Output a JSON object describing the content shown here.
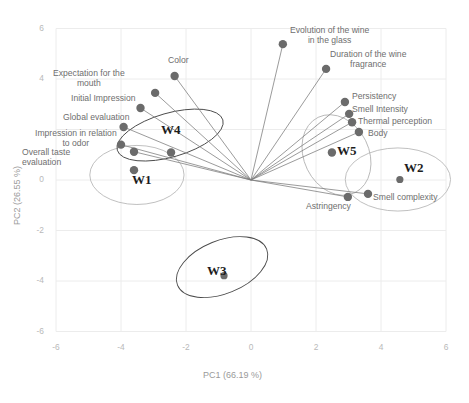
{
  "chart_data": {
    "type": "scatter",
    "title": "",
    "xlabel": "PC1 (66.19 %)",
    "ylabel": "PC2 (26.55 %)",
    "xlim": [
      -6,
      6
    ],
    "ylim": [
      -6,
      6
    ],
    "xticks": [
      -6,
      -4,
      -2,
      0,
      2,
      4,
      6
    ],
    "yticks": [
      -6,
      -4,
      -2,
      0,
      2,
      4,
      6
    ],
    "grid": true,
    "legend": "none",
    "variables": [
      {
        "label": "Color",
        "x": -2.35,
        "y": 4.12
      },
      {
        "label": "Expectation for the\nmouth",
        "x": -2.95,
        "y": 3.45
      },
      {
        "label": "Initial Impression",
        "x": -3.4,
        "y": 2.85
      },
      {
        "label": "Global evaluation",
        "x": -3.92,
        "y": 2.1
      },
      {
        "label": "Impression in relation\nto odor",
        "x": -4.0,
        "y": 1.4
      },
      {
        "label": "Overall taste\nevaluation",
        "x": -3.6,
        "y": 1.12
      },
      {
        "label": "Evolution of the wine\nin the glass",
        "x": 0.98,
        "y": 5.38
      },
      {
        "label": "Duration of the wine\nfragrance",
        "x": 2.31,
        "y": 4.4
      },
      {
        "label": "Persistency",
        "x": 2.89,
        "y": 3.09
      },
      {
        "label": "Smell Intensity",
        "x": 3.02,
        "y": 2.62
      },
      {
        "label": "Thermal perception",
        "x": 3.11,
        "y": 2.29
      },
      {
        "label": "Body",
        "x": 3.32,
        "y": 1.9
      },
      {
        "label": "Astringency",
        "x": 2.98,
        "y": -0.67
      },
      {
        "label": "Smell complexity",
        "x": 3.6,
        "y": -0.55
      }
    ],
    "groups": [
      {
        "label": "W1",
        "x": -3.6,
        "y": 0.39,
        "ellipse": {
          "cx": -3.51,
          "cy": 0.2,
          "rx": 1.45,
          "ry": 1.17,
          "angle": 0
        }
      },
      {
        "label": "W4",
        "x": -2.46,
        "y": 1.09,
        "ellipse": {
          "cx": -2.49,
          "cy": 1.78,
          "rx": 1.69,
          "ry": 0.87,
          "angle": -16
        }
      },
      {
        "label": "W3",
        "x": -0.83,
        "y": -3.79,
        "ellipse": {
          "cx": -0.89,
          "cy": -3.45,
          "rx": 1.48,
          "ry": 1.05,
          "angle": -22
        }
      },
      {
        "label": "W5",
        "x": 2.49,
        "y": 1.09,
        "ellipse": {
          "cx": 2.63,
          "cy": 0.99,
          "rx": 1.0,
          "ry": 1.66,
          "angle": -26
        }
      },
      {
        "label": "W2",
        "x": 4.58,
        "y": 0.02,
        "ellipse": {
          "cx": 4.52,
          "cy": 0.02,
          "rx": 1.62,
          "ry": 1.25,
          "angle": 0
        }
      }
    ],
    "origin": {
      "x": 0,
      "y": 0
    },
    "colors": {
      "point": "#6b6b6b",
      "ray": "#7d7d7d",
      "ellipse_dark": "#4a4a4a",
      "ellipse_light": "#b0b0b0",
      "grid": "#ececec",
      "tick_text": "#b9b9b9",
      "label_text": "#6e6e6e",
      "group_text": "#1d1d1d"
    }
  },
  "axis": {
    "x_title": "PC1 (66.19 %)",
    "y_title": "PC2 (26.55 %)",
    "x_tick_labels": [
      "-6",
      "-4",
      "-2",
      "0",
      "2",
      "4",
      "6"
    ],
    "y_tick_labels": [
      "6",
      "4",
      "2",
      "0",
      "-2",
      "-4",
      "-6"
    ]
  }
}
